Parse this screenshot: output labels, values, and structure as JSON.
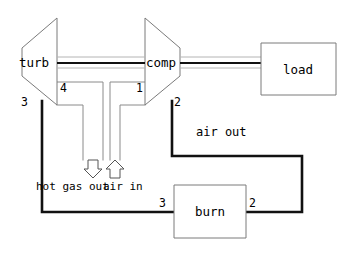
{
  "diagram": {
    "background_color": "#ffffff",
    "line_color": "#111111",
    "outline_color": "#7a7a7a"
  },
  "components": {
    "turbine": {
      "label": "turb"
    },
    "compressor": {
      "label": "comp"
    },
    "load": {
      "label": "load"
    },
    "burner": {
      "label": "burn"
    }
  },
  "stations": {
    "turbine_inlet": "4",
    "compressor_inlet": "1",
    "turbine_outlet": "3",
    "compressor_outlet": "2",
    "burner_inlet": "3",
    "burner_outlet": "2"
  },
  "streams": {
    "hot_gas_out": "hot gas out",
    "air_in": "air in",
    "air_out": "air out"
  },
  "icons": {
    "down_arrow": "down-arrow-icon",
    "up_arrow": "up-arrow-icon"
  }
}
